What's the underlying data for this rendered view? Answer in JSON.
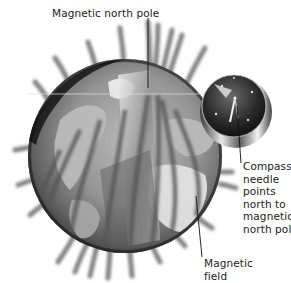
{
  "diagram": {
    "labels": {
      "magnetic_north_pole": "Magnetic north pole",
      "compass": [
        "Compass",
        "needle",
        "points",
        "north to",
        "magnetic",
        "north pole"
      ],
      "magnetic_field": [
        "Magnetic",
        "field"
      ]
    },
    "elements": {
      "globe": "Earth globe (grayscale)",
      "compass": "Compass with needle",
      "field_lines": "Magnetic field lines"
    },
    "colors": {
      "background": "#ffffff",
      "text": "#222222",
      "leader_line": "#111111",
      "globe_dark": "#1c1c1c",
      "globe_land": "#c8c8c8",
      "globe_ocean": "#7a7a7a",
      "field_line": "#6a6a6a"
    }
  }
}
